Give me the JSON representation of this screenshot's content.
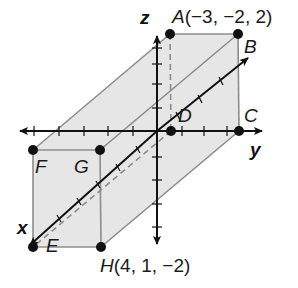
{
  "figure": {
    "colors": {
      "face_fill": "#e6e6e6",
      "edge": "#8c8c8c",
      "axis": "#111111",
      "point": "#111111"
    },
    "axes": {
      "x_label": "x",
      "y_label": "y",
      "z_label": "z"
    },
    "vertices": {
      "A": {
        "name": "A",
        "coords": "(−3, −2, 2)"
      },
      "B": {
        "name": "B",
        "coords": ""
      },
      "C": {
        "name": "C",
        "coords": ""
      },
      "D": {
        "name": "D",
        "coords": ""
      },
      "E": {
        "name": "E",
        "coords": ""
      },
      "F": {
        "name": "F",
        "coords": ""
      },
      "G": {
        "name": "G",
        "coords": ""
      },
      "H": {
        "name": "H",
        "coords": "(4, 1, −2)"
      }
    }
  }
}
